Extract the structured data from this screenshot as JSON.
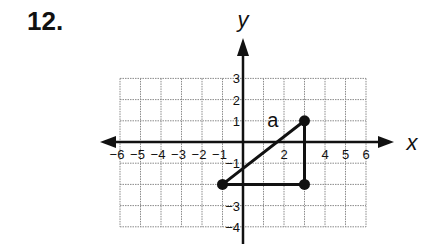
{
  "problem": {
    "number": "12."
  },
  "chart_data": {
    "type": "coordinate-plane",
    "title": "",
    "xlabel": "x",
    "ylabel": "y",
    "xlim": [
      -6,
      6
    ],
    "ylim": [
      -4,
      3
    ],
    "grid": true,
    "x_ticks": [
      -6,
      -5,
      -4,
      -3,
      -2,
      -1,
      2,
      4,
      5,
      6
    ],
    "y_ticks": [
      3,
      2,
      1,
      -1,
      -3,
      -4
    ],
    "points": [
      {
        "x": 3,
        "y": 1
      },
      {
        "x": -1,
        "y": -2
      },
      {
        "x": 3,
        "y": -2
      }
    ],
    "segments": [
      {
        "from": [
          -1,
          -2
        ],
        "to": [
          3,
          1
        ],
        "label": "a"
      },
      {
        "from": [
          -1,
          -2
        ],
        "to": [
          3,
          -2
        ]
      },
      {
        "from": [
          3,
          -2
        ],
        "to": [
          3,
          1
        ]
      }
    ],
    "annotations": [
      {
        "text": "a",
        "x": 1.45,
        "y": 0.7
      }
    ]
  },
  "colors": {
    "axis": "#111111",
    "grid": "#8a8a8a",
    "figure": "#111111"
  }
}
